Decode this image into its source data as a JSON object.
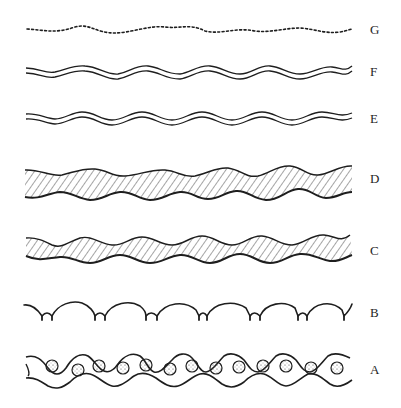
{
  "figure": {
    "ink_color": "#1e1e1e",
    "background": "#ffffff",
    "rows": [
      {
        "label": "G",
        "style": "dotted wavy line",
        "y": 30
      },
      {
        "label": "F",
        "style": "double wavy line",
        "y": 71
      },
      {
        "label": "E",
        "style": "double wavy line",
        "y": 118
      },
      {
        "label": "D",
        "style": "hatched wavy band (irregular)",
        "y": 184
      },
      {
        "label": "C",
        "style": "hatched wavy band (regular)",
        "y": 250
      },
      {
        "label": "B",
        "style": "scalloped arcs with cusps",
        "y": 312
      },
      {
        "label": "A",
        "style": "wavy band with stippled circles",
        "y": 369
      }
    ]
  }
}
